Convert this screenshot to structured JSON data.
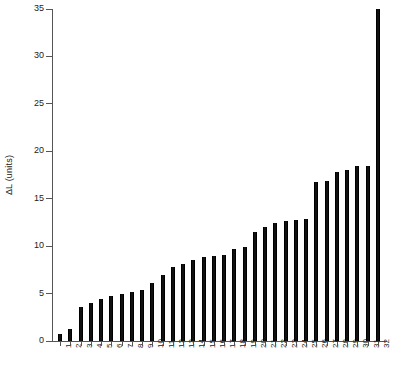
{
  "chart_data": {
    "type": "bar",
    "title": "",
    "xlabel": "",
    "ylabel": "ΔL (units)",
    "ylim": [
      0,
      35
    ],
    "yticks": [
      0,
      5,
      10,
      15,
      20,
      25,
      30,
      35
    ],
    "grid": false,
    "legend": null,
    "bar_color": "#111111",
    "axis_color": "#555555",
    "categories": [
      "1",
      "2",
      "3",
      "4",
      "5",
      "6",
      "7",
      "8",
      "9",
      "10",
      "11",
      "12",
      "13",
      "14",
      "15",
      "16",
      "17",
      "18",
      "19",
      "20",
      "21",
      "22",
      "23",
      "24",
      "25",
      "26",
      "27",
      "28",
      "29",
      "30",
      "31",
      "32"
    ],
    "values": [
      0.7,
      1.3,
      3.6,
      4.0,
      4.4,
      4.7,
      5.0,
      5.2,
      5.4,
      6.1,
      7.0,
      7.8,
      8.1,
      8.5,
      8.9,
      9.0,
      9.1,
      9.7,
      9.9,
      11.5,
      12.0,
      12.4,
      12.7,
      12.8,
      12.9,
      16.8,
      16.9,
      17.8,
      18.0,
      18.4,
      18.5,
      35.0
    ],
    "series": [
      {
        "name": "ΔL",
        "values": [
          0.7,
          1.3,
          3.6,
          4.0,
          4.4,
          4.7,
          5.0,
          5.2,
          5.4,
          6.1,
          7.0,
          7.8,
          8.1,
          8.5,
          8.9,
          9.0,
          9.1,
          9.7,
          9.9,
          11.5,
          12.0,
          12.4,
          12.7,
          12.8,
          12.9,
          16.8,
          16.9,
          17.8,
          18.0,
          18.4,
          18.5,
          35.0
        ]
      }
    ]
  }
}
